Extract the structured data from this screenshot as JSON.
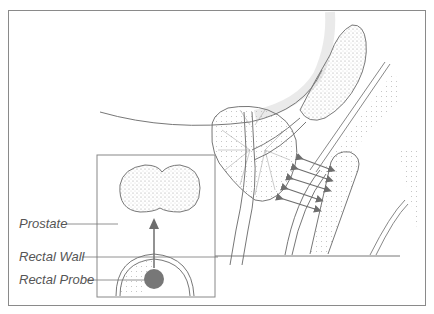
{
  "figure": {
    "type": "anatomical-illustration",
    "labels": [
      {
        "id": "prostate",
        "text": "Prostate"
      },
      {
        "id": "rectal_wall",
        "text": "Rectal Wall"
      },
      {
        "id": "rectal_probe",
        "text": "Rectal Probe"
      }
    ],
    "colors": {
      "line": "#7a7a7a",
      "probe_fill": "#777777",
      "arrow": "#6e6e6e",
      "stipple": "#9a9a9a",
      "border": "#8a8a8a"
    }
  }
}
